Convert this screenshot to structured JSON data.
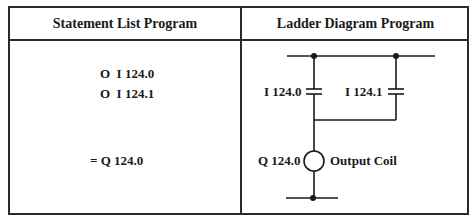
{
  "table": {
    "headers": {
      "statement_list": "Statement List Program",
      "ladder_diagram": "Ladder Diagram Program"
    },
    "statement_list": {
      "lines": [
        "O  I 124.0",
        "O  I 124.1",
        "= Q 124.0"
      ]
    },
    "ladder_diagram": {
      "contacts": [
        {
          "label": "I 124.0",
          "type": "normally-open-contact"
        },
        {
          "label": "I 124.1",
          "type": "normally-open-contact"
        }
      ],
      "coil": {
        "address": "Q 124.0",
        "label": "Output Coil",
        "type": "output-coil"
      },
      "line_color": "#1a1a1a"
    }
  }
}
